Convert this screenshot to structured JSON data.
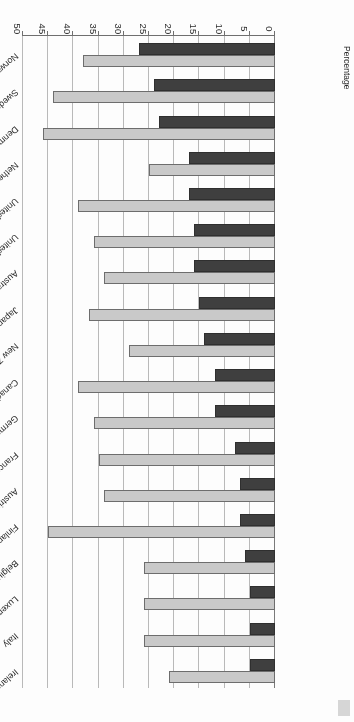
{
  "figure": {
    "rotation_note": "180",
    "axis_title": "Percentage",
    "legend_swatch_name": "legend-swatch-remnant"
  },
  "chart_data": {
    "type": "bar",
    "orientation": "horizontal",
    "title": "",
    "xlabel": "Percentage",
    "ylabel": "",
    "xlim": [
      0,
      50
    ],
    "xticks": [
      0,
      5,
      10,
      15,
      20,
      25,
      30,
      35,
      40,
      45,
      50
    ],
    "xticklabels": [
      "0",
      "5",
      "10",
      "15",
      "20",
      "25",
      "30",
      "35",
      "40",
      "45",
      "50"
    ],
    "grid": true,
    "legend_position": "none",
    "colors": {
      "series1": "#c9c9c9",
      "series2": "#3f3f3f",
      "gridline": "#b9b9b9",
      "axis": "#6f6f6f",
      "text": "#1f1f1f"
    },
    "categories": [
      "Ireland",
      "Italy",
      "Luxembourg",
      "Belgium",
      "Finland",
      "Austria",
      "France",
      "Germany",
      "Canada",
      "New Zealand",
      "Japan",
      "Australia",
      "United Kingdom",
      "United States",
      "Netherlands",
      "Denmark",
      "Sweden",
      "Norway"
    ],
    "series": [
      {
        "name": "series-light",
        "color": "#c9c9c9",
        "values": [
          21,
          26,
          26,
          26,
          45,
          34,
          35,
          36,
          39,
          29,
          37,
          34,
          36,
          39,
          25,
          46,
          44,
          38
        ]
      },
      {
        "name": "series-dark",
        "color": "#3f3f3f",
        "values": [
          5,
          5,
          5,
          6,
          7,
          7,
          8,
          12,
          12,
          14,
          15,
          16,
          16,
          17,
          17,
          23,
          24,
          27
        ]
      }
    ]
  }
}
